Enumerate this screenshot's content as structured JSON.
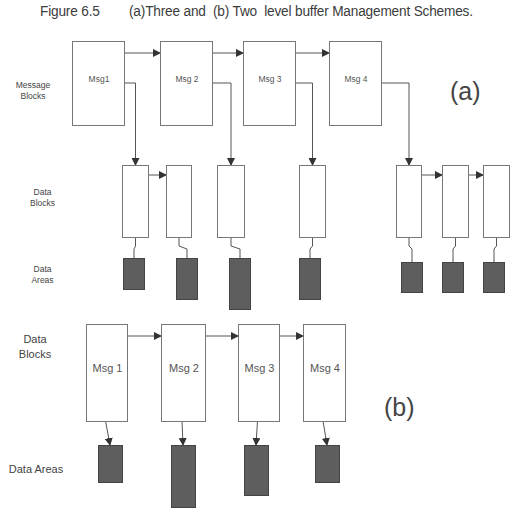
{
  "caption": {
    "figure_number": "Figure 6.5",
    "title": "(a)Three and  (b) Two  level buffer Management Schemes."
  },
  "part_a": {
    "label": "(a)",
    "row_labels": {
      "message_blocks": "Message\nBlocks",
      "data_blocks": "Data\nBlocks",
      "data_areas": "Data\nAreas"
    },
    "message_blocks": [
      {
        "label": "Msg1",
        "x": 72,
        "y": 41,
        "w": 52,
        "h": 84
      },
      {
        "label": "Msg 2",
        "x": 160,
        "y": 41,
        "w": 52,
        "h": 84
      },
      {
        "label": "Msg 3",
        "x": 243,
        "y": 41,
        "w": 52,
        "h": 84
      },
      {
        "label": "Msg 4",
        "x": 329,
        "y": 41,
        "w": 52,
        "h": 84
      }
    ],
    "data_blocks": [
      {
        "x": 122,
        "y": 165,
        "w": 26,
        "h": 72
      },
      {
        "x": 166,
        "y": 165,
        "w": 25,
        "h": 72
      },
      {
        "x": 217,
        "y": 165,
        "w": 27,
        "h": 72
      },
      {
        "x": 299,
        "y": 165,
        "w": 26,
        "h": 72
      },
      {
        "x": 396,
        "y": 165,
        "w": 25,
        "h": 72
      },
      {
        "x": 442,
        "y": 165,
        "w": 26,
        "h": 72
      },
      {
        "x": 483,
        "y": 165,
        "w": 26,
        "h": 72
      }
    ],
    "data_areas": [
      {
        "x": 123,
        "y": 258,
        "w": 21,
        "h": 31
      },
      {
        "x": 176,
        "y": 258,
        "w": 21,
        "h": 41
      },
      {
        "x": 229,
        "y": 258,
        "w": 21,
        "h": 51
      },
      {
        "x": 299,
        "y": 258,
        "w": 21,
        "h": 41
      },
      {
        "x": 401,
        "y": 262,
        "w": 21,
        "h": 30
      },
      {
        "x": 442,
        "y": 262,
        "w": 21,
        "h": 30
      },
      {
        "x": 483,
        "y": 262,
        "w": 21,
        "h": 30
      }
    ]
  },
  "part_b": {
    "label": "(b)",
    "row_labels": {
      "data_blocks": "Data\nBlocks",
      "data_areas": "Data Areas"
    },
    "data_blocks": [
      {
        "label": "Msg 1",
        "x": 86,
        "y": 324,
        "w": 41,
        "h": 97
      },
      {
        "label": "Msg 2",
        "x": 161,
        "y": 324,
        "w": 44,
        "h": 97
      },
      {
        "label": "Msg 3",
        "x": 238,
        "y": 324,
        "w": 41,
        "h": 97
      },
      {
        "label": "Msg 4",
        "x": 303,
        "y": 324,
        "w": 42,
        "h": 97
      }
    ],
    "data_areas": [
      {
        "x": 98,
        "y": 445,
        "w": 24,
        "h": 37
      },
      {
        "x": 171,
        "y": 445,
        "w": 24,
        "h": 62
      },
      {
        "x": 244,
        "y": 445,
        "w": 24,
        "h": 50
      },
      {
        "x": 315,
        "y": 445,
        "w": 24,
        "h": 37
      }
    ]
  },
  "colors": {
    "line": "#555555",
    "box_fill": "#ffffff",
    "box_stroke": "#777777",
    "area_fill": "#5e5e5e",
    "area_stroke": "#444444"
  }
}
